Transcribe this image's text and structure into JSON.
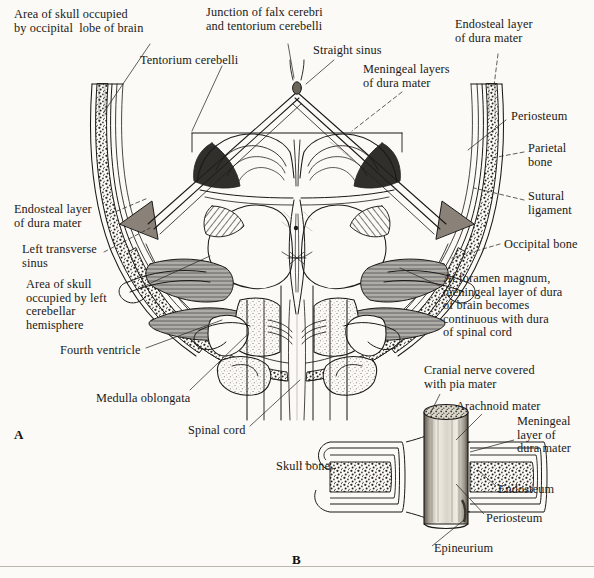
{
  "figure": {
    "background_color": "#fbfaf6",
    "ink_color": "#1a1917",
    "sinus_fill": "#8a8278",
    "panels": [
      {
        "id": "A",
        "label": "A",
        "description": "Posterior view of skull, tentorium cerebelli, cerebellum, medulla and spinal cord showing dural layers"
      },
      {
        "id": "B",
        "label": "B",
        "description": "Cranial nerve passing through skull bone showing continuity of meningeal coverings"
      }
    ]
  },
  "labels_panel_a": [
    {
      "name": "area-of-skull-occipital-lobe",
      "text": "Area of skull occupied\nby occipital  lobe of brain",
      "x": 14,
      "y": 8,
      "align": "left"
    },
    {
      "name": "junction-falx-tentorium",
      "text": "Junction of falx cerebri\nand tentorium cerebelli",
      "x": 206,
      "y": 6,
      "align": "left"
    },
    {
      "name": "endosteal-layer-dura-top",
      "text": "Endosteal layer\nof dura mater",
      "x": 455,
      "y": 18,
      "align": "left"
    },
    {
      "name": "tentorium-cerebelli",
      "text": "Tentorium cerebelli",
      "x": 140,
      "y": 54,
      "align": "left"
    },
    {
      "name": "straight-sinus",
      "text": "Straight sinus",
      "x": 313,
      "y": 44,
      "align": "left"
    },
    {
      "name": "meningeal-layers-dura",
      "text": "Meningeal layers\nof dura mater",
      "x": 363,
      "y": 63,
      "align": "left"
    },
    {
      "name": "periosteum-a",
      "text": "Periosteum",
      "x": 511,
      "y": 110,
      "align": "left"
    },
    {
      "name": "parietal-bone",
      "text": "Parietal\nbone",
      "x": 528,
      "y": 142,
      "align": "left"
    },
    {
      "name": "sutural-ligament",
      "text": "Sutural\nligament",
      "x": 528,
      "y": 190,
      "align": "left"
    },
    {
      "name": "occipital-bone",
      "text": "Occipital bone",
      "x": 504,
      "y": 238,
      "align": "left"
    },
    {
      "name": "endosteal-layer-dura-left",
      "text": "Endosteal layer\nof dura mater",
      "x": 14,
      "y": 203,
      "align": "left"
    },
    {
      "name": "left-transverse-sinus",
      "text": "Left transverse\nsinus",
      "x": 22,
      "y": 243,
      "align": "left"
    },
    {
      "name": "area-of-skull-cerebellar",
      "text": "Area of skull\noccupied by left\ncerebellar\nhemisphere",
      "x": 26,
      "y": 278,
      "align": "left"
    },
    {
      "name": "fourth-ventricle",
      "text": "Fourth ventricle",
      "x": 60,
      "y": 344,
      "align": "left"
    },
    {
      "name": "at-foramen-magnum",
      "text": "At foramen magnum,\nmeningeal layer of dura\nof brain becomes\ncontinuous with dura\nof spinal cord",
      "x": 443,
      "y": 272,
      "align": "left"
    },
    {
      "name": "medulla-oblongata",
      "text": "Medulla oblongata",
      "x": 96,
      "y": 392,
      "align": "left"
    },
    {
      "name": "spinal-cord",
      "text": "Spinal cord",
      "x": 188,
      "y": 424,
      "align": "left"
    }
  ],
  "labels_panel_b": [
    {
      "name": "cranial-nerve-pia-mater",
      "text": "Cranial nerve covered\nwith pia mater",
      "x": 424,
      "y": 364,
      "align": "left"
    },
    {
      "name": "arachnoid-mater",
      "text": "Arachnoid mater",
      "x": 456,
      "y": 400,
      "align": "left"
    },
    {
      "name": "meningeal-layer-dura-b",
      "text": "Meningeal\nlayer of\ndura mater",
      "x": 517,
      "y": 415,
      "align": "left"
    },
    {
      "name": "skull-bone",
      "text": "Skull bone",
      "x": 276,
      "y": 460,
      "align": "left"
    },
    {
      "name": "endosteum",
      "text": "Endosteum",
      "x": 498,
      "y": 483,
      "align": "left"
    },
    {
      "name": "periosteum-b",
      "text": "Periosteum",
      "x": 486,
      "y": 512,
      "align": "left"
    },
    {
      "name": "epineurium",
      "text": "Epineurium",
      "x": 434,
      "y": 542,
      "align": "left"
    }
  ],
  "panel_ids": [
    {
      "name": "panel-a-id",
      "text": "A",
      "x": 14,
      "y": 427
    },
    {
      "name": "panel-b-id",
      "text": "B",
      "x": 292,
      "y": 552
    }
  ]
}
